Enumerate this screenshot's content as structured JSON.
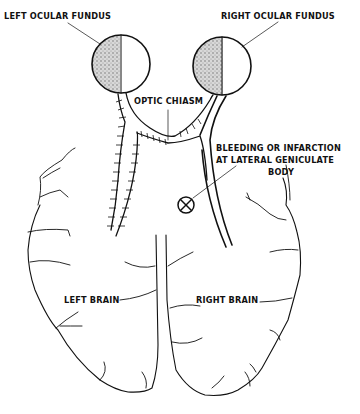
{
  "diagram": {
    "labels": {
      "left_fundus": "LEFT OCULAR FUNDUS",
      "right_fundus": "RIGHT OCULAR FUNDUS",
      "optic_chiasm": "OPTIC CHIASM",
      "lesion_line1": "BLEEDING OR INFARCTION",
      "lesion_line2": "AT LATERAL GENICULATE",
      "lesion_line3": "BODY",
      "left_brain": "LEFT BRAIN",
      "right_brain": "RIGHT BRAIN"
    },
    "symbols": {
      "lesion_marker": "circle-with-x"
    },
    "colors": {
      "ink": "#111111",
      "background": "#ffffff",
      "shading": "#9a9a9a"
    }
  }
}
